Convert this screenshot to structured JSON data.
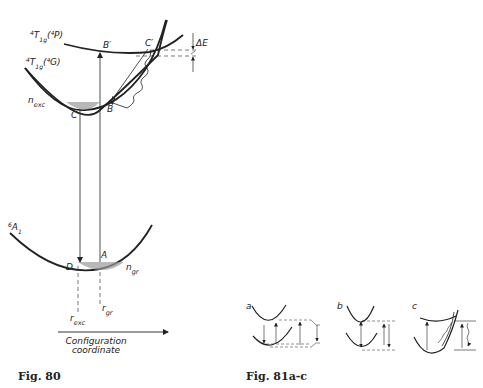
{
  "fig80": {
    "caption": "Fig.  80",
    "curve_upper_label": "⁴T₁g(⁴P)",
    "curve_upper_main": "T",
    "curve_upper_sup": "4",
    "curve_upper_sub": "1g",
    "curve_upper_paren": "(⁴P)",
    "curve_middle_main": "T",
    "curve_middle_sup": "4",
    "curve_middle_sub": "1g",
    "curve_middle_paren": "(⁴G)",
    "curve_lower_main": "A",
    "curve_lower_sup": "6",
    "curve_lower_sub": "1",
    "delta_e": "ΔE",
    "point_b_prime": "B′",
    "point_c_prime": "C′",
    "point_b": "B",
    "point_c": "C",
    "point_a": "A",
    "point_d": "D",
    "n_exc_main": "n",
    "n_exc_sub": "exc",
    "n_gr_main": "n",
    "n_gr_sub": "gr",
    "r_exc_main": "r",
    "r_exc_sub": "exc",
    "r_gr_main": "r",
    "r_gr_sub": "gr",
    "axis_line1": "Configuration",
    "axis_line2": "coordinate"
  },
  "fig81": {
    "caption": "Fig.  81a-c",
    "panels": [
      {
        "label": "a"
      },
      {
        "label": "b"
      },
      {
        "label": "c"
      }
    ]
  },
  "colors": {
    "ink": "#222222",
    "shading": "#9a9a9a"
  }
}
